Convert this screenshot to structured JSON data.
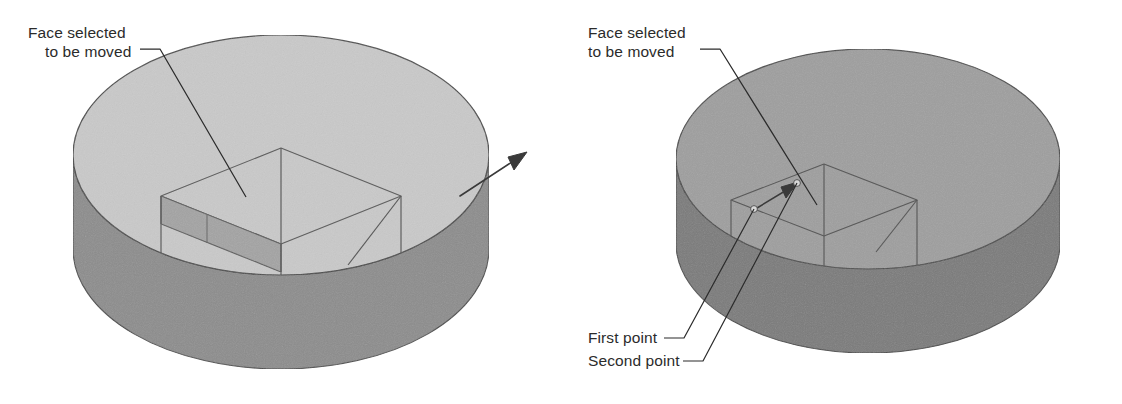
{
  "figure": {
    "background_color": "#ffffff",
    "width": 1122,
    "height": 404
  },
  "palette": {
    "left_top_face": "#c9c9c9",
    "left_side_wall": "#8c8c8c",
    "left_selected_face": "#a3a3a3",
    "right_top_face": "#9e9e9e",
    "right_side_wall": "#7a7a7a",
    "outline": "#4a4a4a",
    "wireframe": "#5a5a5a",
    "leader_line": "#2b2b2b",
    "arrow_fill": "#3a3a3a",
    "text": "#2b2b2b",
    "point_marker": "#d8d8d8"
  },
  "panels": [
    {
      "id": "before",
      "name": "left-panel",
      "description": "Cylindrical part with rectangular boss; one face highlighted and a direction arrow showing the move",
      "labels": [
        {
          "id": "face-selected-left",
          "name": "face-selected-label",
          "lines": [
            "Face selected",
            "to be moved"
          ],
          "x": 28,
          "y": 38
        }
      ],
      "icons": [
        {
          "name": "move-direction-arrow-icon",
          "description": "arrow indicating direction of face movement"
        }
      ]
    },
    {
      "id": "after",
      "name": "right-panel",
      "description": "Same cylindrical part after the face has been moved, with first and second pick points called out",
      "labels": [
        {
          "id": "face-selected-right",
          "name": "face-selected-label",
          "lines": [
            "Face selected",
            "to be moved"
          ],
          "x": 588,
          "y": 38
        },
        {
          "id": "first-point",
          "name": "first-point-label",
          "lines": [
            "First point"
          ],
          "x": 588,
          "y": 343
        },
        {
          "id": "second-point",
          "name": "second-point-label",
          "lines": [
            "Second point"
          ],
          "x": 588,
          "y": 366
        }
      ],
      "icons": [
        {
          "name": "move-direction-arrow-icon",
          "description": "arrow from first point to second point"
        },
        {
          "name": "first-point-marker-icon",
          "description": "small round pick point marker"
        },
        {
          "name": "second-point-marker-icon",
          "description": "small round pick point marker"
        }
      ]
    }
  ]
}
